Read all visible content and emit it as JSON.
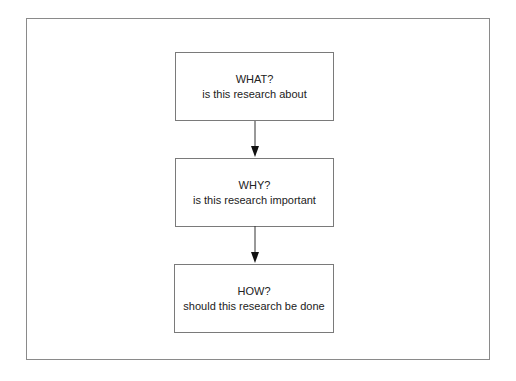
{
  "diagram": {
    "type": "flowchart",
    "boxes": [
      {
        "title": "WHAT?",
        "subtitle": "is this research about"
      },
      {
        "title": "WHY?",
        "subtitle": "is this research important"
      },
      {
        "title": "HOW?",
        "subtitle": "should this research be done"
      }
    ],
    "arrows": [
      {
        "from": "WHAT?",
        "to": "WHY?"
      },
      {
        "from": "WHY?",
        "to": "HOW?"
      }
    ]
  }
}
